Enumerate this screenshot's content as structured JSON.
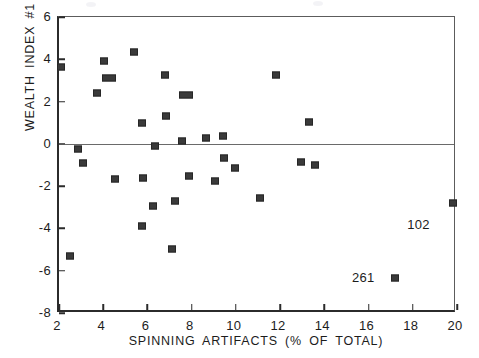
{
  "chart_data": {
    "type": "scatter",
    "title": "",
    "xlabel": "SPINNING  ARTIFACTS  (%  OF  TOTAL)",
    "ylabel": "WEALTH  INDEX  #1",
    "xlim": [
      2,
      20
    ],
    "ylim": [
      -8,
      6
    ],
    "xticks": [
      2,
      4,
      6,
      8,
      10,
      12,
      14,
      16,
      18,
      20
    ],
    "yticks": [
      -8,
      -6,
      -4,
      -2,
      0,
      2,
      4,
      6
    ],
    "grid": false,
    "legend": null,
    "reference_lines": [
      {
        "axis": "y",
        "value": 0,
        "style": "solid"
      }
    ],
    "marker": "filled-square",
    "marker_color": "#3a3a3a",
    "points": [
      {
        "x": 2.1,
        "y": 3.65,
        "overlap": 1
      },
      {
        "x": 2.5,
        "y": -5.3,
        "overlap": 1
      },
      {
        "x": 2.85,
        "y": -0.25,
        "overlap": 1
      },
      {
        "x": 3.1,
        "y": -0.9,
        "overlap": 1
      },
      {
        "x": 3.7,
        "y": 2.4,
        "overlap": 1
      },
      {
        "x": 4.05,
        "y": 3.9,
        "overlap": 1
      },
      {
        "x": 4.25,
        "y": 3.1,
        "overlap": 2
      },
      {
        "x": 4.55,
        "y": -1.65,
        "overlap": 1
      },
      {
        "x": 5.4,
        "y": 4.35,
        "overlap": 1
      },
      {
        "x": 5.75,
        "y": 1.0,
        "overlap": 1
      },
      {
        "x": 5.8,
        "y": -1.6,
        "overlap": 1
      },
      {
        "x": 5.75,
        "y": -3.9,
        "overlap": 1
      },
      {
        "x": 6.25,
        "y": -2.95,
        "overlap": 1
      },
      {
        "x": 6.35,
        "y": -0.1,
        "overlap": 1
      },
      {
        "x": 6.8,
        "y": 3.25,
        "overlap": 1
      },
      {
        "x": 6.85,
        "y": 1.3,
        "overlap": 1
      },
      {
        "x": 7.1,
        "y": -4.95,
        "overlap": 1
      },
      {
        "x": 7.25,
        "y": -2.7,
        "overlap": 1
      },
      {
        "x": 7.55,
        "y": 0.15,
        "overlap": 1
      },
      {
        "x": 7.75,
        "y": 2.3,
        "overlap": 2
      },
      {
        "x": 7.9,
        "y": -1.5,
        "overlap": 1
      },
      {
        "x": 8.65,
        "y": 0.3,
        "overlap": 1
      },
      {
        "x": 9.05,
        "y": -1.75,
        "overlap": 1
      },
      {
        "x": 9.4,
        "y": 0.35,
        "overlap": 1
      },
      {
        "x": 9.45,
        "y": -0.65,
        "overlap": 1
      },
      {
        "x": 9.95,
        "y": -1.15,
        "overlap": 1
      },
      {
        "x": 11.1,
        "y": -2.55,
        "overlap": 1
      },
      {
        "x": 11.8,
        "y": 3.25,
        "overlap": 1
      },
      {
        "x": 12.95,
        "y": -0.85,
        "overlap": 1
      },
      {
        "x": 13.3,
        "y": 1.05,
        "overlap": 1
      },
      {
        "x": 13.6,
        "y": -1.0,
        "overlap": 1
      },
      {
        "x": 17.2,
        "y": -6.35,
        "overlap": 1
      },
      {
        "x": 19.8,
        "y": -2.8,
        "overlap": 1
      }
    ],
    "annotations": [
      {
        "text": "102",
        "x": 18.35,
        "y": -3.85,
        "points_to": {
          "x": 19.8,
          "y": -2.8
        }
      },
      {
        "text": "261",
        "x": 15.85,
        "y": -6.35,
        "points_to": {
          "x": 17.2,
          "y": -6.35
        }
      }
    ]
  }
}
